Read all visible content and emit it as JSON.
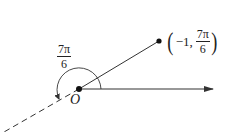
{
  "diagram": {
    "point_label": {
      "r": "−1,",
      "theta_num": "7π",
      "theta_den": "6",
      "open_paren": "(",
      "close_paren": ")"
    },
    "angle_label": {
      "num": "7π",
      "den": "6"
    },
    "origin_label": "O",
    "colors": {
      "stroke": "#333333",
      "background": "#ffffff"
    }
  }
}
